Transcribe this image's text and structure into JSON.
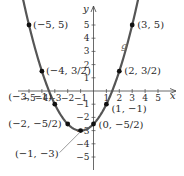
{
  "chart_data": {
    "type": "line",
    "title": "",
    "function": "g(x) = (1/2)x^2 + x - 5/2",
    "curve_label": "g",
    "xlabel": "x",
    "ylabel": "y",
    "xlim": [
      -5.5,
      6
    ],
    "ylim": [
      -5.5,
      5.8
    ],
    "x_ticks": [
      -5,
      -4,
      -3,
      -2,
      -1,
      1,
      2,
      3,
      4,
      5
    ],
    "y_ticks": [
      -5,
      -4,
      -3,
      -2,
      -1,
      1,
      2,
      3,
      4,
      5
    ],
    "x_tick_labels": [
      "−5",
      "−4",
      "−3",
      "−2",
      "−1",
      "1",
      "2",
      "3",
      "4",
      "5"
    ],
    "y_tick_labels": [
      "−5",
      "−4",
      "−3",
      "−2",
      "−1",
      "1",
      "2",
      "3",
      "4",
      "5"
    ],
    "grid": false,
    "legend": null,
    "colors": {
      "curve": "#555555",
      "axes": "#444444",
      "points": "#111111"
    },
    "points": [
      {
        "x": -5,
        "y": 5,
        "label": "(−5, 5)"
      },
      {
        "x": -4,
        "y": 1.5,
        "label": "(−4, 3/2)"
      },
      {
        "x": -3,
        "y": -1,
        "label": "(−3, −1)"
      },
      {
        "x": -2,
        "y": -2.5,
        "label": "(−2, −5/2)"
      },
      {
        "x": -1,
        "y": -3,
        "label": "(−1, −3)"
      },
      {
        "x": 0,
        "y": -2.5,
        "label": "(0, −5/2)"
      },
      {
        "x": 1,
        "y": -1,
        "label": "(1, −1)"
      },
      {
        "x": 2,
        "y": 1.5,
        "label": "(2, 3/2)"
      },
      {
        "x": 3,
        "y": 5,
        "label": "(3, 5)"
      }
    ]
  }
}
